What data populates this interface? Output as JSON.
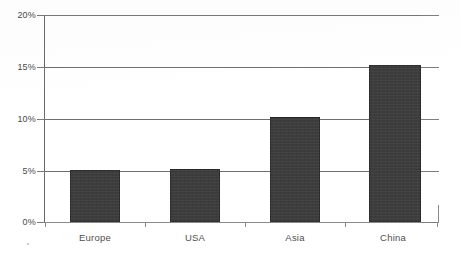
{
  "chart_data": {
    "type": "bar",
    "title": "",
    "xlabel": "",
    "ylabel": "",
    "categories": [
      "Europe",
      "USA",
      "Asia",
      "China"
    ],
    "values": [
      5.0,
      5.1,
      10.1,
      15.2
    ],
    "value_unit": "%",
    "ylim": [
      0,
      20
    ],
    "yticks": [
      0,
      5,
      10,
      15,
      20
    ],
    "ytick_labels": [
      "0%",
      "5%",
      "10%",
      "15%",
      "20%"
    ],
    "grid": true,
    "legend": null,
    "bar_color": "#3b3b3b",
    "grid_color": "#6f6f6f",
    "axis_color": "#6a6a6a",
    "label_color": "#4f4f4f"
  },
  "axis": {
    "y_labels": [
      "20%",
      "15%",
      "10%",
      "5%",
      "0%"
    ]
  },
  "bars": [
    {
      "label": "Europe",
      "value": 5.0,
      "value_text": "5.0%"
    },
    {
      "label": "USA",
      "value": 5.1,
      "value_text": "5.1%"
    },
    {
      "label": "Asia",
      "value": 10.1,
      "value_text": "10.1%"
    },
    {
      "label": "China",
      "value": 15.2,
      "value_text": "15.2%"
    }
  ]
}
